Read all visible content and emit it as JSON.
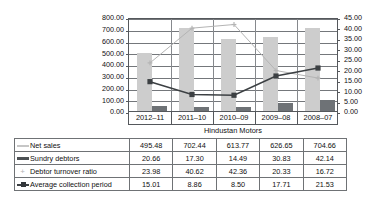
{
  "chart_data": {
    "type": "bar",
    "title": "Hindustan Motors",
    "xlabel": "",
    "ylabel": "",
    "categories": [
      "2012–11",
      "2011–10",
      "2010–09",
      "2009–08",
      "2008–07"
    ],
    "left_axis": {
      "ylim": [
        0,
        800
      ],
      "step": 100,
      "ticks": [
        "0.00",
        "100.00",
        "200.00",
        "300.00",
        "400.00",
        "500.00",
        "600.00",
        "700.00",
        "800.00"
      ]
    },
    "right_axis": {
      "ylim": [
        0,
        45
      ],
      "step": 5,
      "ticks": [
        "0.00",
        "5.00",
        "10.00",
        "15.00",
        "20.00",
        "25.00",
        "30.00",
        "35.00",
        "40.00",
        "45.00"
      ]
    },
    "grid": true,
    "legend_position": "table-below",
    "series": [
      {
        "name": "Net sales",
        "render": "bar",
        "axis": "left",
        "color": "#cdcdcd",
        "values": [
          495.48,
          702.44,
          613.77,
          626.65,
          704.66
        ],
        "labels": [
          "495.48",
          "702.44",
          "613.77",
          "626.65",
          "704.66"
        ]
      },
      {
        "name": "Sundry debtors",
        "render": "bar",
        "axis": "right",
        "color": "#6e7276",
        "values": [
          20.66,
          17.3,
          14.49,
          30.83,
          42.14
        ],
        "labels": [
          "20.66",
          "17.30",
          "14.49",
          "30.83",
          "42.14"
        ]
      },
      {
        "name": "Debtor turnover ratio",
        "render": "line",
        "axis": "right",
        "color": "#b4b4b4",
        "marker": "plus",
        "values": [
          23.98,
          40.62,
          42.36,
          20.33,
          16.72
        ],
        "labels": [
          "23.98",
          "40.62",
          "42.36",
          "20.33",
          "16.72"
        ]
      },
      {
        "name": "Average collection period",
        "render": "line",
        "axis": "right",
        "color": "#3c4043",
        "marker": "square",
        "values": [
          15.01,
          8.86,
          8.5,
          17.71,
          21.53
        ],
        "labels": [
          "15.01",
          "8.86",
          "8.50",
          "17.71",
          "21.53"
        ]
      }
    ]
  },
  "table": {
    "rows": [
      {
        "name": "Net sales",
        "key": "line-light",
        "values": [
          "495.48",
          "702.44",
          "613.77",
          "626.65",
          "704.66"
        ]
      },
      {
        "name": "Sundry debtors",
        "key": "line-dark",
        "values": [
          "20.66",
          "17.30",
          "14.49",
          "30.83",
          "42.14"
        ]
      },
      {
        "name": "Debtor turnover ratio",
        "key": "plus",
        "values": [
          "23.98",
          "40.62",
          "42.36",
          "20.33",
          "16.72"
        ]
      },
      {
        "name": "Average collection period",
        "key": "square",
        "values": [
          "15.01",
          "8.86",
          "8.50",
          "17.71",
          "21.53"
        ]
      }
    ]
  }
}
